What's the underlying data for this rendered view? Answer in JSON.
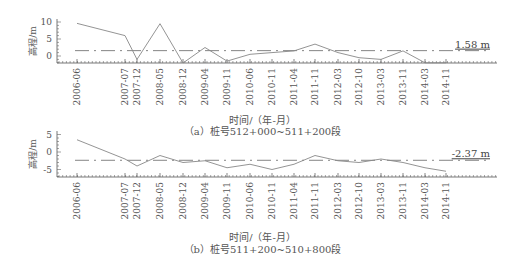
{
  "figure": {
    "xlabel": "时间/（年-月）",
    "ylabel": "高程/m"
  },
  "chart_data": [
    {
      "type": "line",
      "title": "（a）桩号512+000~511+200段",
      "xlabel": "时间/（年-月）",
      "ylabel": "高程/m",
      "categories": [
        "2006-06",
        "2007-07",
        "2007-12",
        "2008-05",
        "2008-12",
        "2009-04",
        "2009-11",
        "2010-06",
        "2010-11",
        "2011-04",
        "2011-11",
        "2012-03",
        "2012-10",
        "2013-03",
        "2013-11",
        "2014-03",
        "2014-11"
      ],
      "series": [
        {
          "name": "高程",
          "values": [
            9.6,
            6.0,
            -1.0,
            9.5,
            -2.5,
            2.5,
            -1.5,
            0.5,
            1.0,
            1.5,
            3.5,
            1.0,
            -0.5,
            -1.0,
            1.5,
            -2.0,
            -2.0
          ]
        }
      ],
      "reference_line": {
        "value": 1.58,
        "label": "1.58 m",
        "style": "dash-dot"
      },
      "yticks": [
        0,
        5,
        10
      ],
      "ylim": [
        -2,
        11
      ],
      "grid": false
    },
    {
      "type": "line",
      "title": "（b）桩号511+200~510+800段",
      "xlabel": "时间/（年-月）",
      "ylabel": "高程/m",
      "categories": [
        "2006-06",
        "2007-07",
        "2007-12",
        "2008-05",
        "2008-12",
        "2009-04",
        "2009-11",
        "2010-06",
        "2010-11",
        "2011-04",
        "2011-11",
        "2012-03",
        "2012-10",
        "2013-03",
        "2013-11",
        "2014-03",
        "2014-11"
      ],
      "series": [
        {
          "name": "高程",
          "values": [
            3.5,
            -2.0,
            -4.0,
            -1.0,
            -3.0,
            -2.5,
            -4.5,
            -3.5,
            -5.0,
            -3.5,
            -1.0,
            -2.5,
            -3.0,
            -2.0,
            -3.0,
            -4.5,
            -5.5
          ]
        }
      ],
      "reference_line": {
        "value": -2.37,
        "label": "-2.37 m",
        "style": "dash-dot"
      },
      "yticks": [
        -5,
        0,
        5
      ],
      "ylim": [
        -7,
        6
      ],
      "grid": false
    }
  ],
  "captions": {
    "a": "（a）桩号512+000~511+200段",
    "b": "（b）桩号511+200~510+800段"
  },
  "ref_labels": {
    "a": "1.58 m",
    "b": "-2.37 m"
  }
}
